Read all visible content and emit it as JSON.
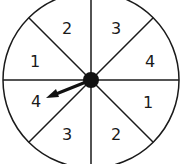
{
  "spinner": {
    "sections": [
      {
        "position": "top-right",
        "label": "3"
      },
      {
        "position": "right-upper",
        "label": "4"
      },
      {
        "position": "right-lower",
        "label": "1"
      },
      {
        "position": "bottom-right",
        "label": "2"
      },
      {
        "position": "bottom-left",
        "label": "3"
      },
      {
        "position": "left-lower",
        "label": "4"
      },
      {
        "position": "left-upper",
        "label": "1"
      },
      {
        "position": "top-left",
        "label": "2"
      }
    ],
    "pointer_target": "4",
    "colors": {
      "line": "#1a1a1a",
      "background": "#ffffff"
    }
  }
}
